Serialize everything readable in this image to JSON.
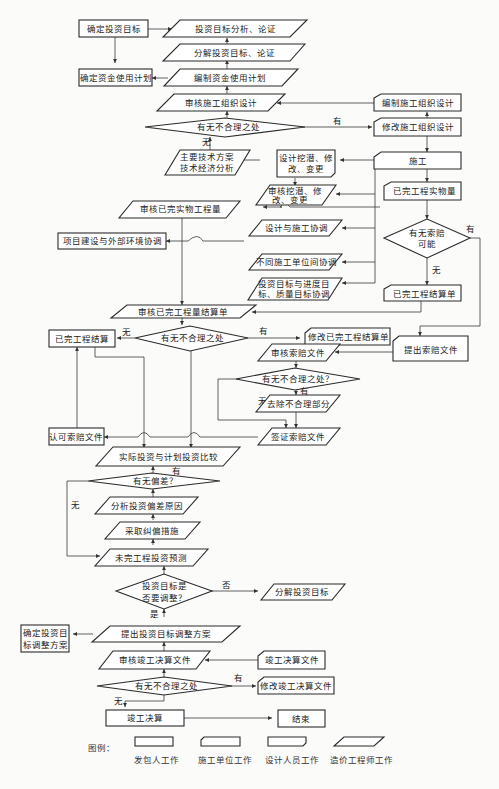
{
  "diagram": {
    "title": "",
    "nodes": {
      "n1": "确定投资目标",
      "n2": "投资目标分析、论证",
      "n3": "分解投资目标、论证",
      "n4": "确定资金使用计划",
      "n5": "编制资金使用计划",
      "n6": "审核施工组织设计",
      "n7": "编制施工组织设计",
      "n8": "有无不合理之处",
      "n9": "修改施工组织设计",
      "n10a": "主要技术方案",
      "n10b": "技术经济分析",
      "n11a": "设计挖潜、修",
      "n11b": "改、变更",
      "n12": "施工",
      "n13a": "审核挖潜、修",
      "n13b": "改、变更",
      "n14": "已完工程实物量",
      "n15": "审核已完实物工程量",
      "n16": "设计与施工协调",
      "n17": "项目建设与外部环境协调",
      "n18a": "有无索赔",
      "n18b": "可能",
      "n19": "不同施工单位间协调",
      "n20a": "投资目标与进度目",
      "n20b": "标、质量目标协调",
      "n21": "已完工程结算单",
      "n22": "审核已完工程量结算单",
      "n23": "已完工程结算",
      "n24": "有无不合理之处",
      "n25": "修改已完工程结算单",
      "n26": "提出索赔文件",
      "n27": "审核索赔文件",
      "n28": "有无不合理之处？",
      "n29": "去除不合理部分",
      "n30": "认可索赔文件",
      "n31": "签证索赔文件",
      "n32": "实际投资与计划投资比较",
      "n33": "有无偏差？",
      "n34": "分析投资偏差原因",
      "n35": "采取纠偏措施",
      "n36": "未完工程投资预测",
      "n37a": "投资目标是",
      "n37b": "否要调整？",
      "n38": "分解投资目标",
      "n39a": "确定投资目",
      "n39b": "标调整方案",
      "n40": "提出投资目标调整方案",
      "n41": "审核竣工决算文件",
      "n42": "竣工决算文件",
      "n43": "有无不合理之处",
      "n44": "修改竣工决算文件",
      "n45": "竣工决算",
      "n46": "结束"
    },
    "edge_labels": {
      "yes": "有",
      "no": "无",
      "shi": "是",
      "fou": "否"
    },
    "legend": {
      "title": "图例：",
      "items": [
        {
          "label": "发包人工作",
          "shape": "rectangle"
        },
        {
          "label": "施工单位工作",
          "shape": "rect-cut-top-left"
        },
        {
          "label": "设计人员工作",
          "shape": "rect-cut-bottom-right"
        },
        {
          "label": "造价工程师工作",
          "shape": "parallelogram"
        }
      ]
    }
  }
}
